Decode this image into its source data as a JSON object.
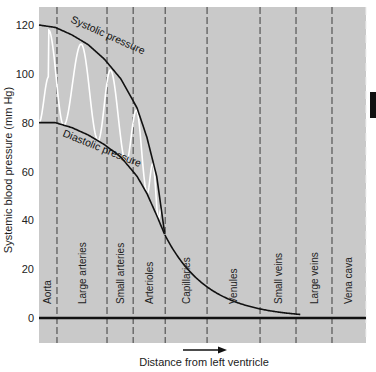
{
  "chart_data": {
    "type": "line",
    "title": "",
    "xlabel": "Distance from left ventricle",
    "ylabel": "Systemic blood pressure (mm Hg)",
    "ylim": [
      -4,
      126
    ],
    "yticks": [
      0,
      20,
      40,
      60,
      80,
      100,
      120
    ],
    "grid": "vertical dashed segment dividers",
    "segments": [
      "Aorta",
      "Large arteries",
      "Small arteries",
      "Arterioles",
      "Capillaries",
      "Venules",
      "Small veins",
      "Large veins",
      "Vena cava"
    ],
    "segment_boundaries": [
      0,
      0.055,
      0.208,
      0.288,
      0.386,
      0.514,
      0.676,
      0.786,
      0.896,
      1.0
    ],
    "series": [
      {
        "name": "Systolic pressure",
        "x": [
          0,
          0.05,
          0.1,
          0.15,
          0.2,
          0.25,
          0.3,
          0.33,
          0.36,
          0.385
        ],
        "values": [
          120,
          119,
          116,
          112,
          106,
          98,
          86,
          74,
          58,
          34
        ]
      },
      {
        "name": "Diastolic pressure",
        "x": [
          0,
          0.05,
          0.1,
          0.15,
          0.2,
          0.25,
          0.3,
          0.33,
          0.36,
          0.385
        ],
        "values": [
          80,
          80,
          78,
          75,
          71,
          66,
          58,
          51,
          42,
          34
        ]
      },
      {
        "name": "Mean pressure (post-arteriole)",
        "x": [
          0.385,
          0.42,
          0.46,
          0.5,
          0.55,
          0.6,
          0.65,
          0.7,
          0.75,
          0.8,
          0.9,
          1.0
        ],
        "values": [
          34,
          25,
          18,
          13,
          9,
          6,
          3.5,
          2,
          1,
          0.5,
          0.2,
          0
        ]
      }
    ],
    "pulse_wave": {
      "name": "Pulsatile pressure trace",
      "color": "#ffffff",
      "peaks_x": [
        0.03,
        0.13,
        0.22,
        0.3,
        0.35
      ],
      "description": "oscillates between diastolic and systolic curves, damping toward arterioles"
    },
    "direction_arrow": "right",
    "colors": {
      "background": "#c9c9c9",
      "curve": "#111111",
      "pulse": "#ffffff",
      "divider": "#555555",
      "zero_line": "#111111"
    }
  }
}
